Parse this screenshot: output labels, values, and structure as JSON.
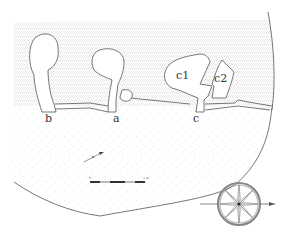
{
  "figure": {
    "type": "archaeological site plan",
    "labels": {
      "chamber_a": "a",
      "chamber_b": "b",
      "chamber_c": "c",
      "chamber_c1": "c1",
      "chamber_c2": "c2"
    },
    "scale_bar": {
      "start_label": "0",
      "end_label": "1 m",
      "segments": 4
    },
    "direction_arrow": "arrow-icon",
    "compass": "compass-rose-icon",
    "colors": {
      "line": "#555555",
      "stipple_dense": "#9a9a9a",
      "stipple_sparse": "#c4c4c4",
      "background": "#ffffff",
      "text": "#333333"
    }
  }
}
